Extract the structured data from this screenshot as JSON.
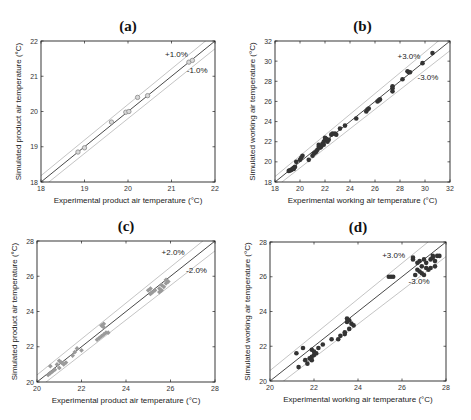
{
  "chart_data": [
    {
      "id": "a",
      "type": "scatter",
      "title": "(a)",
      "xlabel": "Experimental product air temperature (°C)",
      "ylabel": "Simulated product air temperature (°C)",
      "xlim": [
        18,
        22
      ],
      "ylim": [
        18,
        22
      ],
      "xticks": [
        18,
        19,
        20,
        21,
        22
      ],
      "yticks": [
        18,
        19,
        20,
        21,
        22
      ],
      "band_pct": 1.0,
      "band_labels": [
        "+1.0%",
        "-1.0%"
      ],
      "band_label_pos": [
        [
          20.85,
          21.55
        ],
        [
          21.35,
          21.1
        ]
      ],
      "marker": {
        "style": "open-circle",
        "color": "#888888",
        "size": 2.2
      },
      "grid": false,
      "box": [
        41,
        41,
        215,
        182
      ],
      "points": [
        [
          18.85,
          18.85
        ],
        [
          19.0,
          18.97
        ],
        [
          19.62,
          19.7
        ],
        [
          19.95,
          19.98
        ],
        [
          20.02,
          20.0
        ],
        [
          20.22,
          20.4
        ],
        [
          20.45,
          20.45
        ],
        [
          21.4,
          21.4
        ],
        [
          21.48,
          21.45
        ]
      ]
    },
    {
      "id": "b",
      "type": "scatter",
      "title": "(b)",
      "xlabel": "Experimental working air temperature (°C)",
      "ylabel": "Simulated working air temperature (°C)",
      "xlim": [
        18,
        32
      ],
      "ylim": [
        18,
        32
      ],
      "xticks": [
        18,
        20,
        22,
        24,
        26,
        28,
        30,
        32
      ],
      "yticks": [
        18,
        20,
        22,
        24,
        26,
        28,
        30,
        32
      ],
      "band_pct": 3.0,
      "band_labels": [
        "+3.0%",
        "-3.0%"
      ],
      "band_label_pos": [
        [
          27.8,
          30.2
        ],
        [
          29.4,
          28.1
        ]
      ],
      "marker": {
        "style": "filled-circle",
        "color": "#333333",
        "size": 2.3
      },
      "grid": false,
      "box": [
        275,
        41,
        450,
        182
      ],
      "points": [
        [
          19.1,
          19.1
        ],
        [
          19.2,
          19.15
        ],
        [
          19.3,
          19.2
        ],
        [
          19.4,
          19.3
        ],
        [
          19.5,
          19.4
        ],
        [
          19.6,
          19.5
        ],
        [
          19.5,
          19.3
        ],
        [
          19.7,
          20.0
        ],
        [
          20.0,
          20.2
        ],
        [
          20.1,
          20.4
        ],
        [
          20.2,
          20.6
        ],
        [
          20.7,
          20.2
        ],
        [
          21.0,
          20.6
        ],
        [
          21.1,
          20.8
        ],
        [
          21.2,
          20.9
        ],
        [
          21.3,
          21.0
        ],
        [
          21.4,
          21.2
        ],
        [
          21.5,
          21.5
        ],
        [
          21.5,
          21.7
        ],
        [
          21.6,
          21.4
        ],
        [
          21.7,
          21.5
        ],
        [
          21.8,
          21.8
        ],
        [
          21.9,
          22.0
        ],
        [
          21.9,
          21.7
        ],
        [
          22.0,
          22.2
        ],
        [
          22.0,
          22.4
        ],
        [
          22.1,
          22.3
        ],
        [
          22.2,
          22.0
        ],
        [
          22.3,
          22.2
        ],
        [
          22.5,
          22.7
        ],
        [
          22.6,
          22.8
        ],
        [
          22.8,
          22.8
        ],
        [
          22.9,
          22.7
        ],
        [
          23.2,
          23.3
        ],
        [
          23.6,
          23.6
        ],
        [
          24.5,
          24.3
        ],
        [
          25.3,
          25.0
        ],
        [
          25.4,
          25.2
        ],
        [
          25.5,
          25.3
        ],
        [
          26.2,
          26.0
        ],
        [
          26.3,
          26.1
        ],
        [
          26.4,
          26.2
        ],
        [
          27.4,
          27.0
        ],
        [
          27.4,
          27.3
        ],
        [
          27.4,
          27.5
        ],
        [
          28.2,
          28.2
        ],
        [
          28.6,
          29.0
        ],
        [
          28.7,
          28.9
        ],
        [
          28.8,
          28.9
        ],
        [
          29.8,
          29.8
        ],
        [
          30.6,
          30.8
        ]
      ]
    },
    {
      "id": "c",
      "type": "scatter",
      "title": "(c)",
      "xlabel": "Experimental product air temperature (°C)",
      "ylabel": "Simulated product air temperature (°C)",
      "xlim": [
        20,
        28
      ],
      "ylim": [
        20,
        28
      ],
      "xticks": [
        20,
        22,
        24,
        26,
        28
      ],
      "yticks": [
        20,
        22,
        24,
        26,
        28
      ],
      "band_pct": 2.0,
      "band_labels": [
        "+2.0%",
        "-2.0%"
      ],
      "band_label_pos": [
        [
          25.6,
          27.2
        ],
        [
          26.7,
          26.2
        ]
      ],
      "marker": {
        "style": "filled-diamond",
        "color": "#9a9a9a",
        "size": 2.4
      },
      "grid": false,
      "box": [
        37,
        241,
        215,
        382
      ],
      "points": [
        [
          20.5,
          20.4
        ],
        [
          20.6,
          20.5
        ],
        [
          20.7,
          20.6
        ],
        [
          20.8,
          20.7
        ],
        [
          20.6,
          20.9
        ],
        [
          20.9,
          21.0
        ],
        [
          21.0,
          21.2
        ],
        [
          21.1,
          21.1
        ],
        [
          21.2,
          21.0
        ],
        [
          21.3,
          21.1
        ],
        [
          21.0,
          20.8
        ],
        [
          21.6,
          21.5
        ],
        [
          21.7,
          21.7
        ],
        [
          21.8,
          21.9
        ],
        [
          22.0,
          21.8
        ],
        [
          22.7,
          22.4
        ],
        [
          22.8,
          22.5
        ],
        [
          22.9,
          22.6
        ],
        [
          23.0,
          22.7
        ],
        [
          23.1,
          22.8
        ],
        [
          23.2,
          22.8
        ],
        [
          22.9,
          23.2
        ],
        [
          23.0,
          23.1
        ],
        [
          23.0,
          23.3
        ],
        [
          25.0,
          25.2
        ],
        [
          25.1,
          25.3
        ],
        [
          25.2,
          25.1
        ],
        [
          25.1,
          25.0
        ],
        [
          25.3,
          25.2
        ],
        [
          25.5,
          25.3
        ],
        [
          25.6,
          25.5
        ],
        [
          25.7,
          25.4
        ],
        [
          25.6,
          25.2
        ],
        [
          25.8,
          25.6
        ],
        [
          25.8,
          25.8
        ],
        [
          25.9,
          25.7
        ],
        [
          25.5,
          25.1
        ]
      ]
    },
    {
      "id": "d",
      "type": "scatter",
      "title": "(d)",
      "xlabel": "Experimental working air temperature (°C)",
      "ylabel": "Simulated working air temperature (°C)",
      "xlim": [
        20,
        28
      ],
      "ylim": [
        20,
        28
      ],
      "xticks": [
        20,
        22,
        24,
        26,
        28
      ],
      "yticks": [
        20,
        22,
        24,
        26,
        28
      ],
      "band_pct": 3.0,
      "band_labels": [
        "+3.0%",
        "-3.0%"
      ],
      "band_label_pos": [
        [
          25.1,
          27.1
        ],
        [
          26.3,
          25.6
        ]
      ],
      "marker": {
        "style": "filled-circle",
        "color": "#333333",
        "size": 2.3
      },
      "grid": false,
      "box": [
        270,
        242,
        446,
        381
      ],
      "points": [
        [
          21.2,
          21.6
        ],
        [
          21.5,
          21.9
        ],
        [
          21.3,
          20.8
        ],
        [
          21.6,
          21.2
        ],
        [
          21.7,
          21.0
        ],
        [
          21.8,
          21.3
        ],
        [
          21.9,
          21.4
        ],
        [
          21.9,
          21.2
        ],
        [
          22.0,
          21.5
        ],
        [
          22.0,
          21.7
        ],
        [
          22.1,
          21.6
        ],
        [
          21.9,
          21.8
        ],
        [
          22.2,
          21.9
        ],
        [
          22.4,
          22.1
        ],
        [
          22.8,
          22.4
        ],
        [
          23.1,
          22.4
        ],
        [
          23.2,
          22.6
        ],
        [
          23.4,
          22.8
        ],
        [
          23.5,
          23.6
        ],
        [
          23.5,
          23.4
        ],
        [
          23.6,
          23.5
        ],
        [
          23.7,
          23.3
        ],
        [
          23.8,
          23.2
        ],
        [
          23.6,
          23.0
        ],
        [
          23.4,
          22.7
        ],
        [
          25.4,
          26.0
        ],
        [
          25.5,
          26.0
        ],
        [
          25.6,
          26.0
        ],
        [
          26.5,
          27.1
        ],
        [
          26.5,
          27.0
        ],
        [
          26.6,
          26.1
        ],
        [
          26.7,
          26.4
        ],
        [
          26.7,
          26.8
        ],
        [
          26.8,
          26.3
        ],
        [
          26.8,
          26.9
        ],
        [
          26.9,
          26.2
        ],
        [
          26.9,
          26.6
        ],
        [
          27.0,
          27.0
        ],
        [
          27.0,
          26.1
        ],
        [
          27.1,
          26.5
        ],
        [
          27.1,
          26.8
        ],
        [
          27.2,
          26.4
        ],
        [
          27.3,
          26.5
        ],
        [
          27.3,
          27.0
        ],
        [
          27.4,
          27.1
        ],
        [
          27.4,
          27.2
        ],
        [
          27.5,
          26.6
        ],
        [
          27.5,
          26.9
        ],
        [
          27.6,
          27.2
        ],
        [
          27.7,
          27.2
        ]
      ]
    }
  ]
}
